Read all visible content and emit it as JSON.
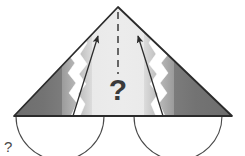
{
  "figure": {
    "center_label": "?",
    "corner_label": "?",
    "colors": {
      "background": "#ffffff",
      "outline": "#2b2b2b",
      "fill_light": "#e8e8e8",
      "fill_mid": "#b5b5b5",
      "fill_dark": "#787878",
      "fill_darker": "#6b6b6b",
      "tear_white": "#ffffff",
      "arc_stroke": "#4a4a4a",
      "arrow_stroke": "#2b2b2b",
      "dash_stroke": "#3a3a3a",
      "text": "#3a3a3a"
    },
    "geometry": {
      "apex": [
        118,
        7
      ],
      "base_left": [
        14,
        116
      ],
      "base_right": [
        232,
        116
      ],
      "baseline_y": 116,
      "tear_left_x": 73,
      "tear_right_x": 163,
      "arc_left_center": [
        60,
        116
      ],
      "arc_left_radius": 44,
      "arc_right_center": [
        178,
        116
      ],
      "arc_right_radius": 44
    },
    "elements": {
      "dashed_axis": "dashed-center-line",
      "arrow_left": "arrow-pointing-to-apex-left",
      "arrow_right": "arrow-pointing-to-apex-right",
      "tear_left": "jagged-tear-left",
      "tear_right": "jagged-tear-right",
      "arc_left": "semicircle-arc-left",
      "arc_right": "semicircle-arc-right"
    }
  }
}
